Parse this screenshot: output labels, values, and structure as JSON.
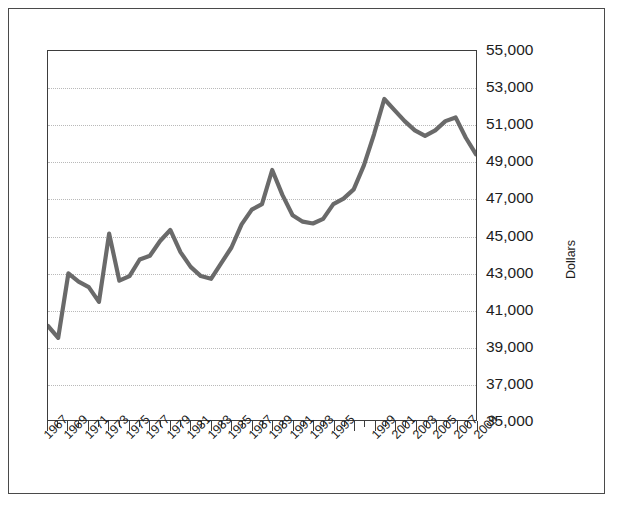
{
  "chart_data": {
    "type": "line",
    "title": "",
    "xlabel": "",
    "ylabel": "Dollars",
    "ylim": [
      35000,
      55000
    ],
    "xlim": [
      1967,
      2009
    ],
    "grid": true,
    "legend": "none",
    "y_ticks": [
      "55,000",
      "53,000",
      "51,000",
      "49,000",
      "47,000",
      "45,000",
      "43,000",
      "41,000",
      "39,000",
      "37,000",
      "35,000"
    ],
    "y_tick_values": [
      55000,
      53000,
      51000,
      49000,
      47000,
      45000,
      43000,
      41000,
      39000,
      37000,
      35000
    ],
    "x_tick_labels": [
      "1967",
      "1969",
      "1971",
      "1973",
      "1975",
      "1977",
      "1979",
      "1981",
      "1983",
      "1985",
      "1987",
      "1989",
      "1991",
      "1993",
      "1995",
      "1999",
      "2001",
      "2003",
      "2005",
      "2007",
      "2009"
    ],
    "x_tick_label_years": [
      1967,
      1969,
      1971,
      1973,
      1975,
      1977,
      1979,
      1981,
      1983,
      1985,
      1987,
      1989,
      1991,
      1993,
      1995,
      1997,
      1999,
      2001,
      2003,
      2005,
      2007,
      2009
    ],
    "line_color": "#6a6a6a",
    "series": [
      {
        "name": "Dollars",
        "x": [
          1967,
          1968,
          1969,
          1970,
          1971,
          1972,
          1973,
          1974,
          1975,
          1976,
          1977,
          1978,
          1979,
          1980,
          1981,
          1982,
          1983,
          1984,
          1985,
          1986,
          1987,
          1988,
          1989,
          1990,
          1991,
          1992,
          1993,
          1994,
          1995,
          1996,
          1997,
          1998,
          1999,
          2000,
          2001,
          2002,
          2003,
          2004,
          2005,
          2006,
          2007,
          2008,
          2009
        ],
        "values": [
          40100,
          39450,
          42950,
          42500,
          42200,
          41400,
          45100,
          42550,
          42800,
          43700,
          43900,
          44700,
          45300,
          44100,
          43300,
          42800,
          42650,
          43500,
          44350,
          45600,
          46400,
          46700,
          48550,
          47200,
          46100,
          45750,
          45650,
          45900,
          46700,
          47000,
          47500,
          48800,
          50500,
          52400,
          51800,
          51200,
          50700,
          50400,
          50700,
          51200,
          51400,
          50300,
          49400
        ]
      }
    ]
  }
}
